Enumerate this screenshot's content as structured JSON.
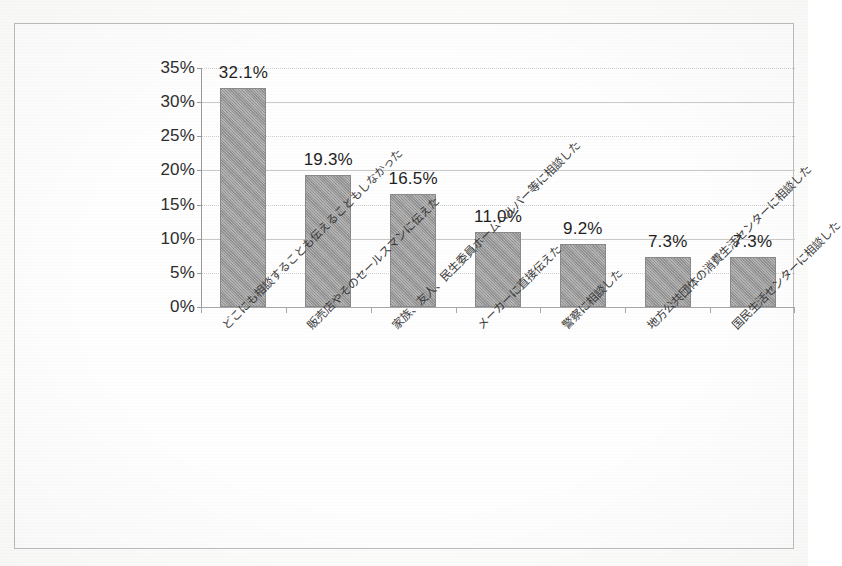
{
  "chart_data": {
    "type": "bar",
    "title": "",
    "subtitle": "",
    "xlabel": "",
    "ylabel": "",
    "ylim": [
      0,
      35
    ],
    "ytick_step": 5,
    "grid": true,
    "legend": "none",
    "orientation": "vertical",
    "value_label_format": "0.0%",
    "categories": [
      "どこにも相談することも伝えることもしなかった",
      "販売店やそのセールスマンに伝えた",
      "家族、友人、民生委員ホームヘルパー等に相談した",
      "メーカーに直接伝えた",
      "警察に相談した",
      "地方公共団体の消費生活センターに相談した",
      "国民生活センターに相談した"
    ],
    "values": [
      32.1,
      19.3,
      16.5,
      11.0,
      9.2,
      7.3,
      7.3
    ],
    "value_labels": [
      "32.1%",
      "19.3%",
      "16.5%",
      "11.0%",
      "9.2%",
      "7.3%",
      "7.3%"
    ],
    "ytick_labels": [
      "0%",
      "5%",
      "10%",
      "15%",
      "20%",
      "25%",
      "30%",
      "35%"
    ],
    "ytick_values": [
      0,
      5,
      10,
      15,
      20,
      25,
      30,
      35
    ],
    "colors": {
      "bar_fill": "#969696",
      "bar_stroke": "#8a8a8a",
      "gridline": "#c9c9c9",
      "axis": "#9a9a9a",
      "text": "#2d2d2d",
      "frame": "#bdbdbd",
      "background": "#fefefe"
    }
  }
}
